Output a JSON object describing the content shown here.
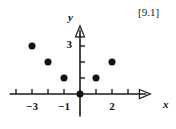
{
  "figure": {
    "label": "[9.1]",
    "background_color": "#ffffff",
    "ink_color": "#1a1a1a"
  },
  "axes": {
    "x_axis_name": "x",
    "y_axis_name": "y",
    "x_tick_labels": [
      {
        "value": -3,
        "text": "−3"
      },
      {
        "value": -1,
        "text": "−1"
      },
      {
        "value": 2,
        "text": "2"
      }
    ],
    "y_tick_labels": [
      {
        "value": 3,
        "text": "3"
      }
    ],
    "x_ticks_unlabeled": [
      -4,
      -2,
      1,
      3
    ],
    "y_ticks_unlabeled": [
      1,
      2
    ],
    "x_arrow": true,
    "y_arrow": true
  },
  "chart_data": {
    "type": "scatter",
    "title": "",
    "subtitle": "",
    "xlabel": "x",
    "ylabel": "y",
    "xlim": [
      -4.4,
      4.4
    ],
    "ylim": [
      -1.4,
      4.2
    ],
    "grid": false,
    "legend": null,
    "annotations": [
      "[9.1]"
    ],
    "x_ticks": [
      -4,
      -3,
      -2,
      -1,
      0,
      1,
      2,
      3
    ],
    "y_ticks": [
      0,
      1,
      2,
      3
    ],
    "x_tick_text": [
      "",
      "−3",
      "",
      "−1",
      "",
      "",
      "2",
      ""
    ],
    "y_tick_text": [
      "",
      "",
      "",
      "3"
    ],
    "marker": "filled-circle",
    "marker_color": "#111111",
    "marker_size_px": 7,
    "points": [
      {
        "x": -3,
        "y": 3
      },
      {
        "x": -2,
        "y": 2
      },
      {
        "x": -1,
        "y": 1
      },
      {
        "x": 0,
        "y": 0
      },
      {
        "x": 1,
        "y": 1
      },
      {
        "x": 2,
        "y": 2
      }
    ],
    "series": [
      {
        "name": "y = |x| pattern",
        "x": [
          -3,
          -2,
          -1,
          0,
          1,
          2
        ],
        "values": [
          3,
          2,
          1,
          0,
          1,
          2
        ]
      }
    ]
  }
}
